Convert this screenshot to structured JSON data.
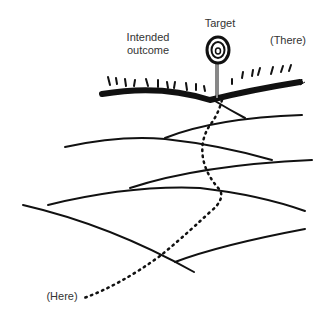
{
  "labels": {
    "target": "Target",
    "intended_line1": "Intended",
    "intended_line2": "outcome",
    "there": "(There)",
    "here": "(Here)"
  },
  "colors": {
    "ink": "#111111",
    "text": "#333333",
    "background": "#ffffff"
  }
}
